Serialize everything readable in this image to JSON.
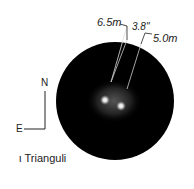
{
  "title": "ι Trianguli",
  "compass": {
    "north": "N",
    "east": "E"
  },
  "annotations": {
    "primary_mag": "6.5m",
    "separation": "3.8\"",
    "secondary_mag": "5.0m"
  }
}
